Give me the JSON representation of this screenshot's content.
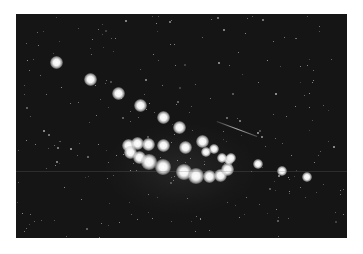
{
  "image": {
    "subject": "Star cluster photograph (night sky, bright stars in curved arc)",
    "background_color": "#151515",
    "frame_color": "#ffffff"
  },
  "bright_stars": [
    {
      "x": 56,
      "y": 62,
      "r": 5
    },
    {
      "x": 90,
      "y": 79,
      "r": 5
    },
    {
      "x": 118,
      "y": 93,
      "r": 5
    },
    {
      "x": 140,
      "y": 105,
      "r": 5
    },
    {
      "x": 163,
      "y": 117,
      "r": 5
    },
    {
      "x": 179,
      "y": 127,
      "r": 5
    },
    {
      "x": 128,
      "y": 145,
      "r": 5
    },
    {
      "x": 137,
      "y": 143,
      "r": 5
    },
    {
      "x": 148,
      "y": 144,
      "r": 5
    },
    {
      "x": 163,
      "y": 145,
      "r": 5
    },
    {
      "x": 185,
      "y": 147,
      "r": 5
    },
    {
      "x": 202,
      "y": 141,
      "r": 5
    },
    {
      "x": 130,
      "y": 152,
      "r": 5
    },
    {
      "x": 139,
      "y": 157,
      "r": 5
    },
    {
      "x": 149,
      "y": 162,
      "r": 6
    },
    {
      "x": 163,
      "y": 167,
      "r": 6
    },
    {
      "x": 184,
      "y": 172,
      "r": 6
    },
    {
      "x": 196,
      "y": 176,
      "r": 6
    },
    {
      "x": 209,
      "y": 176,
      "r": 5
    },
    {
      "x": 220,
      "y": 175,
      "r": 5
    },
    {
      "x": 227,
      "y": 169,
      "r": 5
    },
    {
      "x": 229,
      "y": 160,
      "r": 4
    },
    {
      "x": 222,
      "y": 158,
      "r": 4
    },
    {
      "x": 231,
      "y": 158,
      "r": 4
    },
    {
      "x": 214,
      "y": 149,
      "r": 4
    },
    {
      "x": 206,
      "y": 152,
      "r": 4
    },
    {
      "x": 258,
      "y": 164,
      "r": 4
    },
    {
      "x": 282,
      "y": 171,
      "r": 4
    },
    {
      "x": 307,
      "y": 177,
      "r": 4
    }
  ],
  "streak": {
    "x1": 217,
    "y1": 121,
    "x2": 257,
    "y2": 136
  },
  "scanline_y": 171
}
